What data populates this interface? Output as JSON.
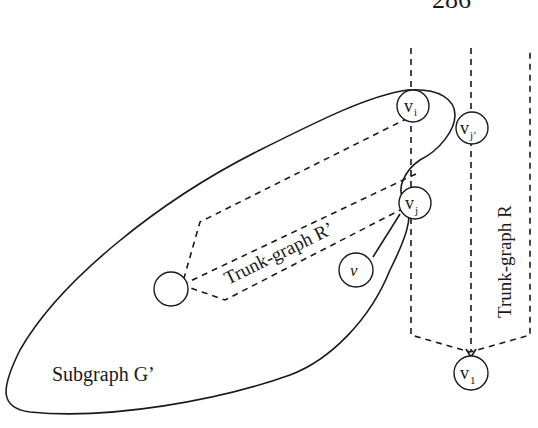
{
  "page_number": "286",
  "labels": {
    "subgraph": "Subgraph G’",
    "trunk_r_prime": "Trunk-graph R’",
    "trunk_r": "Trunk-graph R"
  },
  "nodes": [
    {
      "id": "vi",
      "base": "v",
      "sub": "i"
    },
    {
      "id": "vj_prime",
      "base": "v",
      "sub": "j’"
    },
    {
      "id": "vj",
      "base": "v",
      "sub": "j"
    },
    {
      "id": "v",
      "base": "v",
      "sub": ""
    },
    {
      "id": "root",
      "base": "",
      "sub": ""
    },
    {
      "id": "v1",
      "base": "v",
      "sub": "1"
    }
  ]
}
